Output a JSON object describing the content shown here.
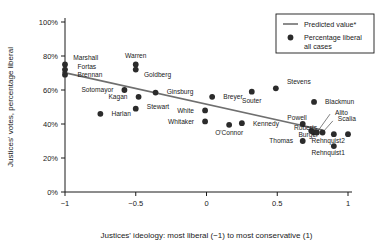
{
  "chart_data": {
    "type": "scatter",
    "title": "",
    "xlabel": "Justices' ideology: most liberal (−1) to most conservative (1)",
    "ylabel": "Justices' votes, percentage liberal",
    "xlim": [
      -1.12,
      1.06
    ],
    "ylim": [
      0,
      100
    ],
    "grid": false,
    "xticks": [
      -1,
      -0.5,
      0,
      0.5,
      1
    ],
    "xticklabels": [
      "−1",
      "−0.5",
      "0",
      "0.5",
      "1"
    ],
    "yticks": [
      0,
      20,
      40,
      60,
      80,
      100
    ],
    "yticklabels": [
      "0%",
      "20%",
      "40%",
      "60%",
      "80%",
      "100%"
    ],
    "legend_position": "top-right",
    "legend": [
      {
        "key": "predicted-value",
        "label": "Predicted value*",
        "marker": "line",
        "color": "#6f6f6f"
      },
      {
        "key": "percentage-liberal",
        "label": "Percentage liberal",
        "label2": "all cases",
        "marker": "dot",
        "color": "#2b2b2b"
      }
    ],
    "series": [
      {
        "name": "Percentage liberal all cases",
        "marker": "dot",
        "points": [
          {
            "label": "Marshall",
            "x": -1.0,
            "y": 75,
            "lx": -0.97,
            "ly": 79,
            "anchor": "start"
          },
          {
            "label": "Fortas",
            "x": -1.0,
            "y": 72,
            "lx": -0.94,
            "ly": 74,
            "anchor": "start"
          },
          {
            "label": "Brennan",
            "x": -1.0,
            "y": 69,
            "lx": -0.94,
            "ly": 69,
            "anchor": "start"
          },
          {
            "label": "Warren",
            "x": -0.5,
            "y": 75,
            "lx": -0.5,
            "ly": 80,
            "anchor": "middle"
          },
          {
            "label": "Goldberg",
            "x": -0.5,
            "y": 72,
            "lx": -0.47,
            "ly": 69,
            "anchor": "start"
          },
          {
            "label": "Sotomayor",
            "x": -0.58,
            "y": 60,
            "lx": -0.63,
            "ly": 60,
            "anchor": "end"
          },
          {
            "label": "Kagan",
            "x": -0.48,
            "y": 56,
            "lx": -0.53,
            "ly": 56,
            "anchor": "end"
          },
          {
            "label": "Ginsburg",
            "x": -0.36,
            "y": 58.5,
            "lx": -0.31,
            "ly": 59,
            "anchor": "start"
          },
          {
            "label": "Stewart",
            "x": -0.5,
            "y": 49,
            "lx": -0.45,
            "ly": 50,
            "anchor": "start"
          },
          {
            "label": "Harlan",
            "x": -0.75,
            "y": 46,
            "lx": -0.7,
            "ly": 46,
            "anchor": "start"
          },
          {
            "label": "Breyer",
            "x": 0.04,
            "y": 56,
            "lx": 0.09,
            "ly": 56,
            "anchor": "start"
          },
          {
            "label": "White",
            "x": -0.01,
            "y": 48,
            "lx": -0.06,
            "ly": 48,
            "anchor": "end"
          },
          {
            "label": "Whitaker",
            "x": -0.01,
            "y": 41.5,
            "lx": -0.06,
            "ly": 41.5,
            "anchor": "end"
          },
          {
            "label": "O'Connor",
            "x": 0.16,
            "y": 39.5,
            "lx": 0.16,
            "ly": 35,
            "anchor": "middle"
          },
          {
            "label": "Kennedy",
            "x": 0.25,
            "y": 40.5,
            "lx": 0.3,
            "ly": 40.5,
            "anchor": "start"
          },
          {
            "label": "Souter",
            "x": 0.32,
            "y": 59,
            "lx": 0.32,
            "ly": 54,
            "anchor": "middle"
          },
          {
            "label": "Stevens",
            "x": 0.49,
            "y": 61,
            "lx": 0.54,
            "ly": 65,
            "anchor": "start"
          },
          {
            "label": "Blackmun",
            "x": 0.76,
            "y": 53,
            "lx": 0.81,
            "ly": 53,
            "anchor": "start"
          },
          {
            "label": "Powell",
            "x": 0.68,
            "y": 40,
            "lx": 0.64,
            "ly": 44,
            "anchor": "middle"
          },
          {
            "label": "Roberts",
            "x": 0.74,
            "y": 36,
            "lx": 0.7,
            "ly": 38,
            "anchor": "middle"
          },
          {
            "label": "Burger",
            "x": 0.76,
            "y": 35,
            "lx": 0.72,
            "ly": 34,
            "anchor": "middle"
          },
          {
            "label": "Thomas",
            "x": 0.68,
            "y": 30,
            "lx": 0.64,
            "ly": 30,
            "anchor": "end"
          },
          {
            "label": "Alito",
            "x": 0.78,
            "y": 35,
            "lx": 0.88,
            "ly": 47,
            "anchor": "start",
            "leader": true
          },
          {
            "label": "Scalia",
            "x": 0.82,
            "y": 35,
            "lx": 0.9,
            "ly": 43,
            "anchor": "start",
            "leader": true
          },
          {
            "label": "Rehnquist2",
            "x": 0.9,
            "y": 34,
            "lx": 0.86,
            "ly": 30,
            "anchor": "middle"
          },
          {
            "label": "Rehnquist1",
            "x": 0.9,
            "y": 27,
            "lx": 0.86,
            "ly": 23,
            "anchor": "middle"
          },
          {
            "label": "",
            "x": 1.0,
            "y": 34,
            "lx": 1.0,
            "ly": 34,
            "anchor": "middle"
          }
        ]
      },
      {
        "name": "Predicted value*",
        "marker": "line",
        "line": [
          {
            "x": -1.02,
            "y": 70.5
          },
          {
            "x": 0.82,
            "y": 36.5
          }
        ]
      }
    ]
  }
}
